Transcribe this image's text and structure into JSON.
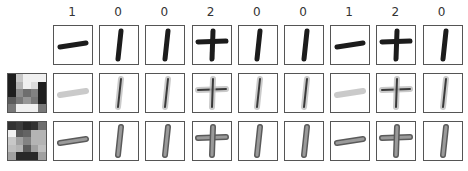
{
  "labels": [
    "1",
    "0",
    "0",
    "2",
    "0",
    "0",
    "1",
    "2",
    "0"
  ],
  "column_glyphs": [
    "minus",
    "bar",
    "bar",
    "plus",
    "bar",
    "bar",
    "minus",
    "plus",
    "bar"
  ],
  "rows": [
    {
      "style": "original"
    },
    {
      "style": "reconstruction_faded"
    },
    {
      "style": "reconstruction_outlined"
    }
  ],
  "filter_grids": [
    {
      "name": "filter-a",
      "values": [
        [
          30,
          200,
          240,
          240,
          240
        ],
        [
          30,
          180,
          240,
          220,
          30
        ],
        [
          30,
          140,
          110,
          130,
          30
        ],
        [
          90,
          120,
          150,
          120,
          30
        ],
        [
          120,
          240,
          240,
          240,
          120
        ]
      ]
    },
    {
      "name": "filter-b",
      "values": [
        [
          50,
          60,
          40,
          50,
          110
        ],
        [
          240,
          90,
          100,
          180,
          180
        ],
        [
          200,
          160,
          130,
          180,
          180
        ],
        [
          190,
          180,
          90,
          160,
          190
        ],
        [
          160,
          40,
          40,
          40,
          160
        ]
      ]
    }
  ]
}
